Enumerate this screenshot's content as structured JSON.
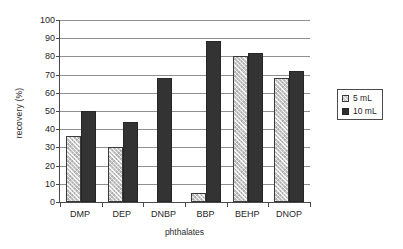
{
  "chart_data": {
    "type": "bar",
    "title": "",
    "subtitle": "",
    "xlabel": "phthalates",
    "ylabel": "recovery (%)",
    "categories": [
      "DMP",
      "DEP",
      "DNBP",
      "BBP",
      "BEHP",
      "DNOP"
    ],
    "series": [
      {
        "name": "5 mL",
        "color": "#c9c9c9",
        "values": [
          36,
          30,
          0,
          5,
          80.5,
          68
        ]
      },
      {
        "name": "10 mL",
        "color": "#333333",
        "values": [
          50,
          44,
          68,
          88.5,
          82,
          72
        ]
      }
    ],
    "ylim": [
      0,
      100
    ],
    "ytick_step": 10,
    "yticks": [
      0,
      10,
      20,
      30,
      40,
      50,
      60,
      70,
      80,
      90,
      100
    ],
    "ytick_labels": [
      "0",
      "10",
      "20",
      "30",
      "40",
      "50",
      "60",
      "70",
      "80",
      "90",
      "100"
    ],
    "grid": "horizontal",
    "legend_position": "right",
    "legend_entries": [
      "5 mL",
      "10 mL"
    ]
  }
}
